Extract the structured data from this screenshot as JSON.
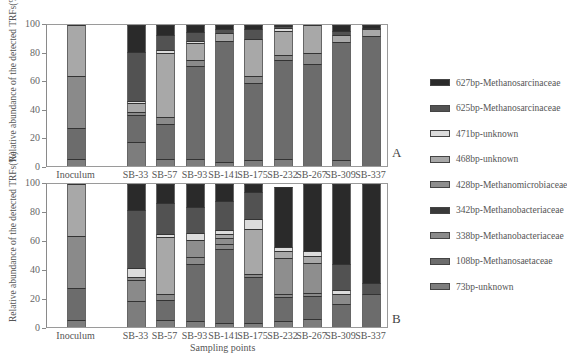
{
  "chart_data": [
    {
      "type": "bar",
      "stacked": true,
      "panel": "A",
      "title": "",
      "xlabel": "",
      "ylabel": "Relative abundance of the detected TRFs(%)",
      "ylim": [
        0,
        100
      ],
      "yticks": [
        0,
        20,
        40,
        60,
        80,
        100
      ],
      "categories": [
        "Inoculum",
        "",
        "SB-33",
        "SB-57",
        "SB-93",
        "SB-141",
        "SB-175",
        "SB-232",
        "SB-267",
        "SB-309",
        "SB-337"
      ],
      "series": [
        {
          "name": "73bp-unknown",
          "values": [
            5,
            0,
            17,
            5,
            5,
            3,
            4,
            5,
            0,
            4,
            0
          ]
        },
        {
          "name": "108bp-Methanosaetaceae",
          "values": [
            22,
            0,
            19,
            25,
            66,
            86,
            55,
            70,
            72,
            84,
            92
          ]
        },
        {
          "name": "338bp-Methanobacteriaceae",
          "values": [
            37,
            0,
            2,
            5,
            4,
            0,
            5,
            4,
            8,
            0,
            0
          ]
        },
        {
          "name": "342bp-Methanobacteriaceae",
          "values": [
            0,
            0,
            0,
            0,
            0,
            0,
            0,
            0,
            0,
            0,
            0
          ]
        },
        {
          "name": "428bp-Methanomicrobiaceae",
          "values": [
            0,
            0,
            0,
            0,
            0,
            0,
            0,
            0,
            0,
            0,
            0
          ]
        },
        {
          "name": "468bp-unknown",
          "values": [
            36,
            0,
            7,
            45,
            12,
            5,
            26,
            17,
            20,
            5,
            5
          ]
        },
        {
          "name": "471bp-unknown",
          "values": [
            0,
            0,
            1,
            2,
            2,
            0,
            0,
            2,
            0,
            0,
            0
          ]
        },
        {
          "name": "625bp-Methanosarcinaceae",
          "values": [
            0,
            0,
            35,
            11,
            6,
            3,
            7,
            1,
            0,
            3,
            1
          ]
        },
        {
          "name": "627bp-Methanosarcinaceae",
          "values": [
            0,
            0,
            19,
            7,
            5,
            3,
            3,
            1,
            0,
            4,
            2
          ]
        }
      ]
    },
    {
      "type": "bar",
      "stacked": true,
      "panel": "B",
      "title": "",
      "xlabel": "Sampling points",
      "ylabel": "Relative abundance of the detected TRFs(%)",
      "ylim": [
        0,
        100
      ],
      "yticks": [
        0,
        20,
        40,
        60,
        80,
        100
      ],
      "categories": [
        "Inoculum",
        "",
        "SB-33",
        "SB-57",
        "SB-93",
        "SB-141",
        "SB-175",
        "SB-232",
        "SB-267",
        "SB-309",
        "SB-337"
      ],
      "series": [
        {
          "name": "73bp-unknown",
          "values": [
            5,
            0,
            18,
            5,
            4,
            3,
            3,
            4,
            6,
            0,
            0
          ]
        },
        {
          "name": "108bp-Methanosaetaceae",
          "values": [
            22,
            0,
            0,
            14,
            40,
            53,
            33,
            17,
            16,
            16,
            23
          ]
        },
        {
          "name": "338bp-Methanobacteriaceae",
          "values": [
            37,
            0,
            15,
            4,
            5,
            4,
            2,
            2,
            2,
            7,
            0
          ]
        },
        {
          "name": "342bp-Methanobacteriaceae",
          "values": [
            0,
            0,
            0,
            0,
            0,
            0,
            0,
            0,
            0,
            0,
            0
          ]
        },
        {
          "name": "428bp-Methanomicrobiaceae",
          "values": [
            0,
            0,
            2,
            0,
            12,
            4,
            0,
            25,
            21,
            0,
            0
          ]
        },
        {
          "name": "468bp-unknown",
          "values": [
            36,
            0,
            0,
            40,
            0,
            3,
            32,
            5,
            5,
            0,
            0
          ]
        },
        {
          "name": "471bp-unknown",
          "values": [
            0,
            0,
            6,
            2,
            5,
            3,
            7,
            3,
            4,
            3,
            0
          ]
        },
        {
          "name": "625bp-Methanosarcinaceae",
          "values": [
            0,
            0,
            41,
            22,
            18,
            21,
            19,
            0,
            0,
            18,
            8
          ]
        },
        {
          "name": "627bp-Methanosarcinaceae",
          "values": [
            0,
            0,
            18,
            13,
            16,
            12,
            6,
            42,
            47,
            56,
            69
          ]
        }
      ]
    }
  ],
  "figure": {
    "ylabel": "Relative abundance of the detected TRFs(%)",
    "xlabel": "Sampling points",
    "panel_labels": [
      "A",
      "B"
    ],
    "yticks": [
      "0",
      "20",
      "40",
      "60",
      "80",
      "100"
    ],
    "x_labels": [
      "Inoculum",
      "SB-33",
      "SB-57",
      "SB-93",
      "SB-141",
      "SB-175",
      "SB-232",
      "SB-267",
      "SB-309",
      "SB-337"
    ]
  },
  "legend": [
    {
      "label": "627bp-Methanosarcinaceae",
      "color": "#2a2a2a"
    },
    {
      "label": "625bp-Methanosarcinaceae",
      "color": "#525252"
    },
    {
      "label": "471bp-unknown",
      "color": "#dcdcdc"
    },
    {
      "label": "468bp-unknown",
      "color": "#a8a8a8"
    },
    {
      "label": "428bp-Methanomicrobiaceae",
      "color": "#8e8e8e"
    },
    {
      "label": "342bp-Methanobacteriaceae",
      "color": "#3a3a3a"
    },
    {
      "label": "338bp-Methanobacteriaceae",
      "color": "#8a8a8a"
    },
    {
      "label": "108bp-Methanosaetaceae",
      "color": "#6c6c6c"
    },
    {
      "label": "73bp-unknown",
      "color": "#7d7d7d"
    }
  ],
  "series_colors": {
    "73bp-unknown": "#7d7d7d",
    "108bp-Methanosaetaceae": "#6c6c6c",
    "338bp-Methanobacteriaceae": "#8a8a8a",
    "342bp-Methanobacteriaceae": "#3a3a3a",
    "428bp-Methanomicrobiaceae": "#8e8e8e",
    "468bp-unknown": "#a8a8a8",
    "471bp-unknown": "#dcdcdc",
    "625bp-Methanosarcinaceae": "#525252",
    "627bp-Methanosarcinaceae": "#2a2a2a"
  }
}
